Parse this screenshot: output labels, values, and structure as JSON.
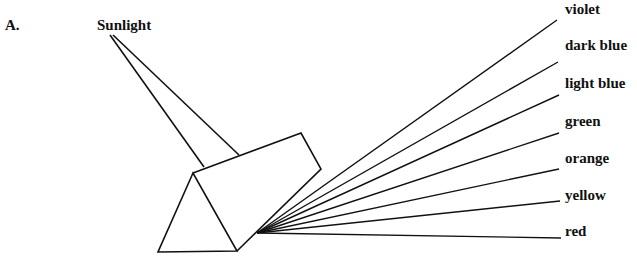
{
  "figure_label": "A.",
  "source_label": "Sunlight",
  "spectrum": [
    {
      "name": "violet",
      "end": [
        557,
        20
      ],
      "label_pos": [
        565,
        2
      ]
    },
    {
      "name": "dark blue",
      "end": [
        558,
        62
      ],
      "label_pos": [
        565,
        38
      ]
    },
    {
      "name": "light blue",
      "end": [
        559,
        95
      ],
      "label_pos": [
        565,
        76
      ]
    },
    {
      "name": "green",
      "end": [
        559,
        133
      ],
      "label_pos": [
        565,
        114
      ]
    },
    {
      "name": "orange",
      "end": [
        559,
        169
      ],
      "label_pos": [
        565,
        151
      ]
    },
    {
      "name": "yellow",
      "end": [
        560,
        201
      ],
      "label_pos": [
        565,
        188
      ]
    },
    {
      "name": "red",
      "end": [
        561,
        238
      ],
      "label_pos": [
        565,
        224
      ]
    }
  ],
  "ray_origin": [
    257,
    233
  ],
  "colors": {
    "line": "#111111",
    "background": "#ffffff"
  }
}
